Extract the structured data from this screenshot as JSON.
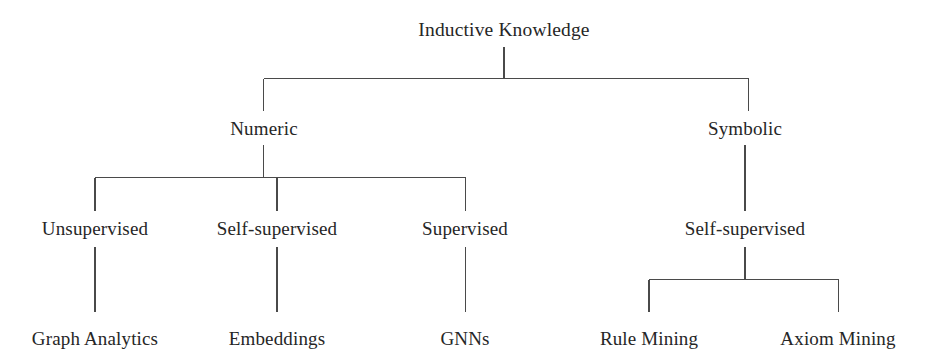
{
  "diagram": {
    "title": "Inductive Knowledge",
    "type": "tree-taxonomy",
    "orientation": "top-down",
    "colors": {
      "background": "#ffffff",
      "text": "#262626",
      "connector": "#4a4a4a"
    },
    "levels": [
      {
        "level": 1,
        "nodes": [
          {
            "id": "inductive-knowledge",
            "label": "Inductive Knowledge",
            "x": 504,
            "y": 30
          }
        ]
      },
      {
        "level": 2,
        "nodes": [
          {
            "id": "numeric",
            "label": "Numeric",
            "x": 264,
            "y": 128
          },
          {
            "id": "symbolic",
            "label": "Symbolic",
            "x": 745,
            "y": 128
          }
        ]
      },
      {
        "level": 3,
        "nodes": [
          {
            "id": "numeric-unsupervised",
            "label": "Unsupervised",
            "x": 95,
            "y": 228
          },
          {
            "id": "numeric-self-supervised",
            "label": "Self-supervised",
            "x": 277,
            "y": 228
          },
          {
            "id": "numeric-supervised",
            "label": "Supervised",
            "x": 465,
            "y": 228
          },
          {
            "id": "symbolic-self-supervised",
            "label": "Self-supervised",
            "x": 745,
            "y": 228
          }
        ]
      },
      {
        "level": 4,
        "nodes": [
          {
            "id": "graph-analytics",
            "label": "Graph Analytics",
            "x": 95,
            "y": 338
          },
          {
            "id": "embeddings",
            "label": "Embeddings",
            "x": 277,
            "y": 338
          },
          {
            "id": "gnns",
            "label": "GNNs",
            "x": 465,
            "y": 338
          },
          {
            "id": "rule-mining",
            "label": "Rule Mining",
            "x": 649,
            "y": 338
          },
          {
            "id": "axiom-mining",
            "label": "Axiom Mining",
            "x": 838,
            "y": 338
          }
        ]
      }
    ],
    "edges": [
      {
        "from": "inductive-knowledge",
        "to": "numeric"
      },
      {
        "from": "inductive-knowledge",
        "to": "symbolic"
      },
      {
        "from": "numeric",
        "to": "numeric-unsupervised"
      },
      {
        "from": "numeric",
        "to": "numeric-self-supervised"
      },
      {
        "from": "numeric",
        "to": "numeric-supervised"
      },
      {
        "from": "symbolic",
        "to": "symbolic-self-supervised"
      },
      {
        "from": "numeric-unsupervised",
        "to": "graph-analytics"
      },
      {
        "from": "numeric-self-supervised",
        "to": "embeddings"
      },
      {
        "from": "numeric-supervised",
        "to": "gnns"
      },
      {
        "from": "symbolic-self-supervised",
        "to": "rule-mining"
      },
      {
        "from": "symbolic-self-supervised",
        "to": "axiom-mining"
      }
    ]
  }
}
